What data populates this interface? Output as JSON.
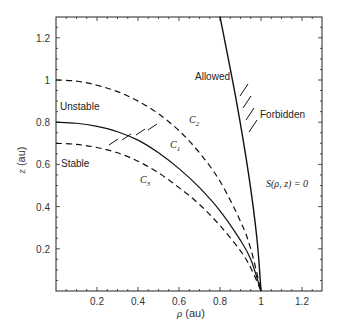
{
  "chart_data": {
    "type": "line",
    "title": "",
    "xlabel": "ρ (au)",
    "ylabel": "z (au)",
    "xlim": [
      0,
      1.3
    ],
    "ylim": [
      0,
      1.3
    ],
    "x_ticks": [
      "0.2",
      "0.4",
      "0.6",
      "0.8",
      "1",
      "1.2"
    ],
    "x_tick_values": [
      0.2,
      0.4,
      0.6,
      0.8,
      1.0,
      1.2
    ],
    "y_ticks": [
      "0.2",
      "0.4",
      "0.6",
      "0.8",
      "1",
      "1.2"
    ],
    "y_tick_values": [
      0.2,
      0.4,
      0.6,
      0.8,
      1.0,
      1.2
    ],
    "grid": false,
    "series": [
      {
        "name": "C1",
        "style": "solid",
        "x": [
          0,
          0.1,
          0.2,
          0.3,
          0.4,
          0.5,
          0.6,
          0.7,
          0.8,
          0.9,
          0.95,
          1.0
        ],
        "y": [
          0.8,
          0.795,
          0.78,
          0.755,
          0.715,
          0.655,
          0.58,
          0.49,
          0.38,
          0.24,
          0.15,
          0.0
        ]
      },
      {
        "name": "C2",
        "style": "dashed",
        "x": [
          0,
          0.1,
          0.2,
          0.3,
          0.4,
          0.5,
          0.6,
          0.7,
          0.8,
          0.9,
          0.95,
          1.0
        ],
        "y": [
          1.0,
          0.995,
          0.975,
          0.945,
          0.9,
          0.84,
          0.76,
          0.655,
          0.52,
          0.33,
          0.2,
          0.0
        ]
      },
      {
        "name": "C3",
        "style": "dashed",
        "x": [
          0,
          0.1,
          0.2,
          0.3,
          0.4,
          0.5,
          0.6,
          0.7,
          0.8,
          0.9,
          0.95,
          1.0
        ],
        "y": [
          0.7,
          0.695,
          0.68,
          0.655,
          0.615,
          0.56,
          0.49,
          0.41,
          0.31,
          0.19,
          0.11,
          0.0
        ]
      },
      {
        "name": "S(ρ,z)=0",
        "style": "solid",
        "x": [
          0.8,
          0.88,
          0.94,
          0.98,
          1.0
        ],
        "y": [
          1.3,
          0.9,
          0.55,
          0.25,
          0.0
        ]
      }
    ],
    "annotations": [
      {
        "text": "Unstable",
        "x": 0.02,
        "y": 0.84
      },
      {
        "text": "Stable",
        "x": 0.02,
        "y": 0.6
      },
      {
        "text": "Allowed",
        "x": 0.6,
        "y": 1.0
      },
      {
        "text": "Forbidden",
        "x": 0.98,
        "y": 0.8
      },
      {
        "text": "C2",
        "x": 0.6,
        "y": 0.84
      },
      {
        "text": "C1",
        "x": 0.54,
        "y": 0.7
      },
      {
        "text": "C3",
        "x": 0.42,
        "y": 0.52
      },
      {
        "text": "S(ρ, z) = 0",
        "x": 1.05,
        "y": 0.48
      }
    ],
    "hatching": [
      {
        "on": "C1",
        "side": "below",
        "x_range": [
          0.3,
          0.5
        ]
      },
      {
        "on": "S(ρ,z)=0",
        "side": "right",
        "y_range": [
          0.7,
          0.9
        ]
      }
    ]
  },
  "labels": {
    "xlabel_rho": "ρ",
    "xlabel_unit": " (au)",
    "ylabel_z": "z",
    "ylabel_unit": " (au)",
    "unstable": "Unstable",
    "stable": "Stable",
    "allowed": "Allowed",
    "forbidden": "Forbidden",
    "c1": "C",
    "c1_sub": "1",
    "c2": "C",
    "c2_sub": "2",
    "c3": "C",
    "c3_sub": "3",
    "s_eq": "S(ρ, z) = 0"
  }
}
